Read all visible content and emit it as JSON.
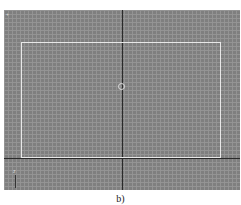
{
  "viewport": {
    "corner_label": "+",
    "grid": "on",
    "background_color": "#7f7f7f",
    "grid_color": "#969696",
    "axis_color": "#2a2a2a",
    "safe_frame_color": "#e8e8e8",
    "tripod_label": "z"
  },
  "caption": "b)"
}
